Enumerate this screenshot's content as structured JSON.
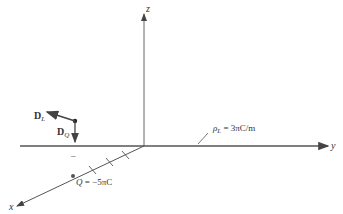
{
  "diagram": {
    "type": "3d-coordinate-axes-electrostatics",
    "axes": {
      "z_label": "z",
      "y_label": "y",
      "x_label": "x"
    },
    "line_charge": {
      "symbol": "ρ",
      "subscript": "L",
      "value_text": "= 3πC/m"
    },
    "point_charge": {
      "symbol": "Q",
      "value_text": "= −5πC"
    },
    "vectors": {
      "dl_symbol": "D",
      "dl_subscript": "L",
      "dq_symbol": "D",
      "dq_subscript": "Q"
    },
    "minus_mark": "–",
    "colors": {
      "line": "#555555",
      "text": "#333333",
      "vector": "#444444",
      "point": "#222222"
    }
  }
}
